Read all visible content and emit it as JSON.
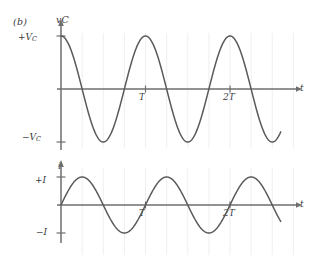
{
  "figure": {
    "panel_label": "(b)",
    "background": "#ffffff",
    "curve_color": "#5a5a5a",
    "axis_color": "#6e6e6e",
    "grid_color": "#efeef2",
    "text_color": "#3a3a3a"
  },
  "chart_data": [
    {
      "type": "line",
      "name": "capacitor-voltage",
      "title": "",
      "xlabel": "t",
      "ylabel": "v_C",
      "ylabel_display": "v",
      "ylabel_sub": "C",
      "waveform": "cosine",
      "amplitude": 1,
      "periods": 2.6,
      "phase_deg": 0,
      "x_tick_labels": [
        "T",
        "2T"
      ],
      "x_tick_values": [
        1,
        2
      ],
      "y_tick_labels": [
        "+V_C",
        "-V_C"
      ],
      "y_tick_values": [
        1,
        -1
      ],
      "y_tick_top_display": "+V",
      "y_tick_top_sub": "C",
      "y_tick_bottom_display": "−V",
      "y_tick_bottom_sub": "C",
      "ylim": [
        -1.12,
        1.12
      ],
      "xlim": [
        0,
        2.6
      ],
      "grid": true,
      "grid_interval": 0.25,
      "legend": "none",
      "samples": [
        {
          "t": 0.0,
          "v": 1.0
        },
        {
          "t": 0.25,
          "v": 0.0
        },
        {
          "t": 0.5,
          "v": -1.0
        },
        {
          "t": 0.75,
          "v": 0.0
        },
        {
          "t": 1.0,
          "v": 1.0
        },
        {
          "t": 1.25,
          "v": 0.0
        },
        {
          "t": 1.5,
          "v": -1.0
        },
        {
          "t": 1.75,
          "v": 0.0
        },
        {
          "t": 2.0,
          "v": 1.0
        },
        {
          "t": 2.25,
          "v": 0.0
        },
        {
          "t": 2.5,
          "v": -1.0
        },
        {
          "t": 2.6,
          "v": -0.95
        }
      ]
    },
    {
      "type": "line",
      "name": "current",
      "title": "",
      "xlabel": "t",
      "ylabel": "i",
      "ylabel_display": "i",
      "ylabel_sub": "",
      "waveform": "sine",
      "amplitude": 1,
      "periods": 2.6,
      "phase_deg": 0,
      "x_tick_labels": [
        "T",
        "2T"
      ],
      "x_tick_values": [
        1,
        2
      ],
      "y_tick_labels": [
        "+I",
        "-I"
      ],
      "y_tick_values": [
        1,
        -1
      ],
      "y_tick_top_display": "+I",
      "y_tick_top_sub": "",
      "y_tick_bottom_display": "−I",
      "y_tick_bottom_sub": "",
      "ylim": [
        -1.12,
        1.12
      ],
      "xlim": [
        0,
        2.6
      ],
      "grid": true,
      "grid_interval": 0.25,
      "legend": "none",
      "samples": [
        {
          "t": 0.0,
          "v": 0.0
        },
        {
          "t": 0.25,
          "v": 1.0
        },
        {
          "t": 0.5,
          "v": 0.0
        },
        {
          "t": 0.75,
          "v": -1.0
        },
        {
          "t": 1.0,
          "v": 0.0
        },
        {
          "t": 1.25,
          "v": 1.0
        },
        {
          "t": 1.5,
          "v": 0.0
        },
        {
          "t": 1.75,
          "v": -1.0
        },
        {
          "t": 2.0,
          "v": 0.0
        },
        {
          "t": 2.25,
          "v": 1.0
        },
        {
          "t": 2.5,
          "v": 0.0
        },
        {
          "t": 2.6,
          "v": -0.6
        }
      ]
    }
  ]
}
